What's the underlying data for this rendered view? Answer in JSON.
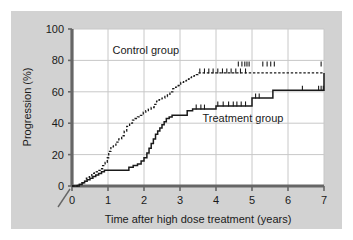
{
  "figure": {
    "panel_bg": "#d2d2d2",
    "plot_bg": "#ffffff",
    "outer_bg": "#ffffff",
    "gridline_color": "#c8c8c8",
    "axis_color": "#666666",
    "curve_color": "#1a1a1a"
  },
  "chart_data": {
    "type": "line",
    "title": "",
    "subtitle": "",
    "xlabel": "Time after high dose treatment (years)",
    "ylabel": "Progression (%)",
    "xlim": [
      0,
      7
    ],
    "ylim": [
      0,
      100
    ],
    "xticks": [
      0,
      1,
      2,
      3,
      4,
      5,
      6,
      7
    ],
    "xtick_labels": [
      "0",
      "1",
      "2",
      "3",
      "4",
      "5",
      "6",
      "7"
    ],
    "yticks": [
      0,
      20,
      40,
      60,
      80,
      100
    ],
    "ytick_labels": [
      "0",
      "20",
      "40",
      "60",
      "80",
      "100"
    ],
    "grid": true,
    "grid_axis": "both",
    "axis_break_at_origin": true,
    "legend_position": "inline-annotation",
    "annotations": [
      {
        "text": "Control group",
        "x": 2.05,
        "y": 84
      },
      {
        "text": "Treatment group",
        "x": 4.75,
        "y": 41
      }
    ],
    "series": [
      {
        "name": "Control group",
        "style": "dashed",
        "step": "post",
        "final_value": 72,
        "x": [
          0,
          0.15,
          0.25,
          0.32,
          0.4,
          0.48,
          0.55,
          0.62,
          0.7,
          0.78,
          0.85,
          0.92,
          0.98,
          1.02,
          1.08,
          1.15,
          1.22,
          1.3,
          1.38,
          1.45,
          1.52,
          1.6,
          1.68,
          1.75,
          1.82,
          1.9,
          1.98,
          2.05,
          2.12,
          2.2,
          2.28,
          2.35,
          2.42,
          2.5,
          2.58,
          2.65,
          2.72,
          2.8,
          2.88,
          2.95,
          3.02,
          3.1,
          3.18,
          3.25,
          3.32,
          3.4,
          3.5,
          7.0
        ],
        "y": [
          0,
          1,
          2,
          3,
          5,
          6,
          8,
          9,
          10,
          11,
          13,
          15,
          18,
          22,
          25,
          26,
          28,
          30,
          32,
          35,
          38,
          40,
          42,
          43,
          44,
          45,
          47,
          48,
          49,
          50,
          52,
          54,
          55,
          56,
          57,
          58,
          60,
          62,
          63,
          64,
          66,
          67,
          68,
          69,
          70,
          71,
          72,
          72
        ],
        "censor_marks_on_curve": [
          3.55,
          3.68,
          3.8,
          3.92,
          4.05,
          4.18,
          4.3,
          4.42,
          4.55,
          4.68,
          4.82
        ],
        "censor_marks_upper_row": [
          4.62,
          4.72,
          4.8,
          4.86,
          4.92,
          5.3,
          5.42,
          5.52,
          5.62,
          6.92
        ],
        "censor_row_y": 77
      },
      {
        "name": "Treatment group",
        "style": "solid",
        "step": "post",
        "final_value": 72,
        "x": [
          0,
          0.2,
          0.28,
          0.35,
          0.42,
          0.5,
          0.58,
          0.66,
          0.74,
          0.82,
          0.9,
          0.98,
          1.5,
          1.58,
          1.7,
          1.82,
          1.92,
          2.0,
          2.08,
          2.14,
          2.2,
          2.26,
          2.32,
          2.38,
          2.44,
          2.5,
          2.56,
          2.62,
          2.7,
          2.78,
          2.86,
          2.95,
          3.2,
          3.35,
          4.0,
          5.0,
          5.3,
          5.58,
          7.0
        ],
        "y": [
          0,
          1,
          2,
          3,
          4,
          5,
          6,
          7,
          8,
          9,
          10,
          10,
          10,
          12,
          13,
          14,
          16,
          18,
          21,
          24,
          27,
          30,
          33,
          35,
          37,
          39,
          41,
          43,
          44,
          45,
          45,
          45,
          48,
          49,
          51,
          56,
          56,
          61,
          72
        ],
        "censor_marks_on_curve": [
          3.45,
          3.58,
          3.68,
          4.05,
          4.2,
          4.35,
          4.48,
          4.58,
          4.7,
          4.82,
          5.1,
          5.2,
          6.4,
          6.85,
          6.92,
          6.98
        ],
        "censor_row_y": null
      }
    ]
  }
}
